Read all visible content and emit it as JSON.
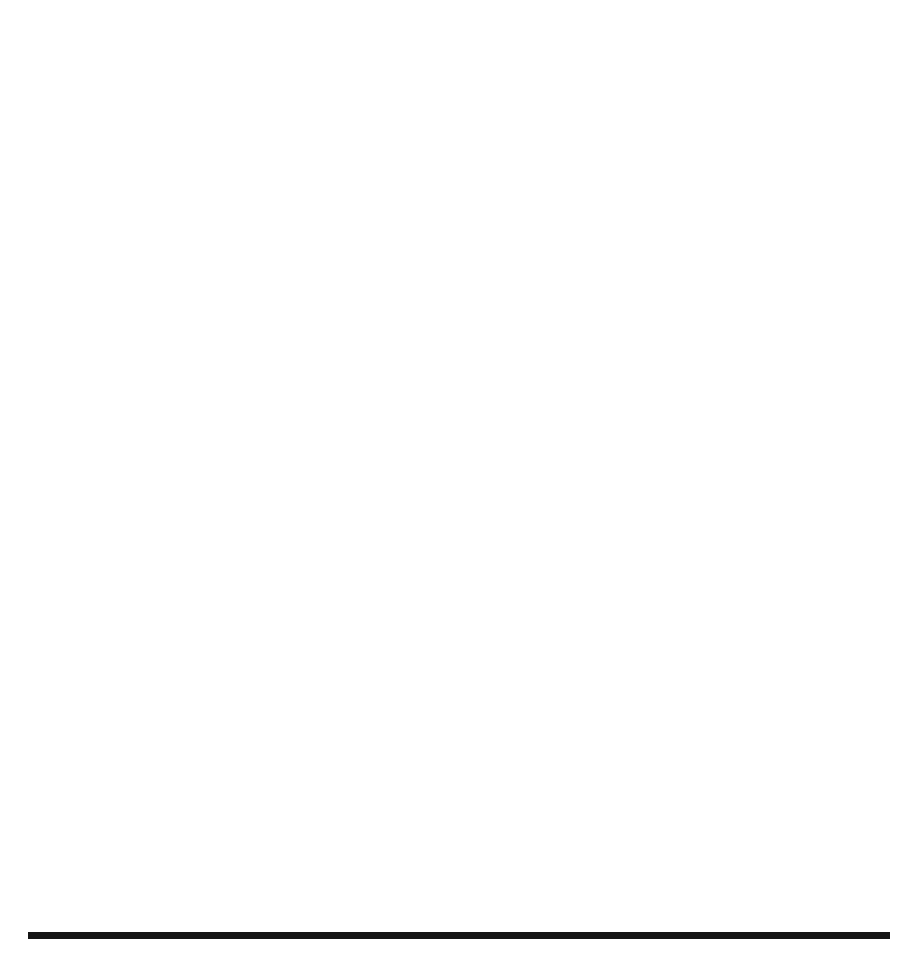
{
  "figure": {
    "panel_label": "(c)",
    "rule_color": "#151515"
  },
  "chart_data": [
    {
      "id": "top",
      "type": "line",
      "title": "",
      "xlabel": "Number of Rounds",
      "ylabel": "Objective: Delay",
      "xlim": [
        0,
        520
      ],
      "ylim": [
        1.88,
        2.52
      ],
      "xticks": [
        0,
        100,
        200,
        300,
        400,
        500
      ],
      "yticks": [
        1.9,
        2.0,
        2.1,
        2.2,
        2.3,
        2.4,
        2.5
      ],
      "ytick_labels": [
        "1.9",
        "2.0",
        "2.1",
        "2.2",
        "2.3",
        "2.4",
        "2.5"
      ],
      "xtick_labels": [
        "0",
        "100",
        "200",
        "300",
        "400",
        "500"
      ],
      "grid": false,
      "frame": true,
      "legend_position": "top-right",
      "series": [
        {
          "name": "CMPS",
          "marker": "circle-open",
          "line": "dotted",
          "x": [
            50,
            100,
            150,
            200,
            270,
            350,
            400,
            500
          ],
          "values": [
            2.33,
            2.3,
            2.27,
            2.23,
            2.005,
            1.932,
            1.913,
            1.905
          ]
        },
        {
          "name": "CPS",
          "marker": "triangle",
          "line": "dashed",
          "x": [
            50,
            100,
            150,
            200,
            270,
            350,
            400,
            500
          ],
          "values": [
            2.33,
            2.325,
            2.285,
            2.255,
            2.105,
            1.963,
            1.94,
            1.925
          ]
        },
        {
          "name": "FMPS",
          "marker": "square",
          "line": "solid",
          "x": [
            50,
            100,
            150,
            200,
            270,
            350,
            400,
            500
          ],
          "values": [
            2.43,
            2.385,
            2.3,
            2.2,
            2.055,
            1.998,
            1.978,
            1.956
          ]
        }
      ]
    },
    {
      "id": "bottom",
      "type": "line",
      "title": "",
      "xlabel": "Number of Rounds",
      "ylabel": "Fitness: Evaluations",
      "xlim": [
        -18,
        520
      ],
      "ylim": [
        -70,
        1560
      ],
      "xticks": [
        0,
        100,
        200,
        300,
        400,
        500
      ],
      "yticks": [
        0,
        500,
        1000,
        1500
      ],
      "ytick_labels": [
        "0",
        "500",
        "1000",
        "1500"
      ],
      "xtick_labels": [
        "0",
        "100",
        "200",
        "300",
        "400",
        "500"
      ],
      "grid": false,
      "frame": true,
      "legend_position": "top-left",
      "series": [
        {
          "name": "CMPS",
          "marker": "circle-filled",
          "line": "dotted",
          "x": [
            0,
            50,
            100,
            150,
            200,
            250,
            300,
            350,
            400,
            450,
            500
          ],
          "values": [
            5,
            150,
            305,
            435,
            550,
            635,
            775,
            895,
            1010,
            1150,
            1310
          ]
        },
        {
          "name": "CPS",
          "marker": "triangle",
          "line": "dashed",
          "x": [
            0,
            50,
            100,
            150,
            200,
            250,
            300,
            350,
            400,
            450,
            500
          ],
          "values": [
            5,
            150,
            305,
            435,
            565,
            700,
            850,
            975,
            1120,
            1255,
            1420
          ]
        },
        {
          "name": "FMPS",
          "marker": "square",
          "line": "solid",
          "x": [
            0,
            50,
            100,
            150,
            200,
            250,
            300,
            350,
            400,
            450,
            500
          ],
          "values": [
            5,
            150,
            305,
            435,
            570,
            705,
            865,
            1000,
            1165,
            1335,
            1500
          ]
        }
      ]
    }
  ]
}
